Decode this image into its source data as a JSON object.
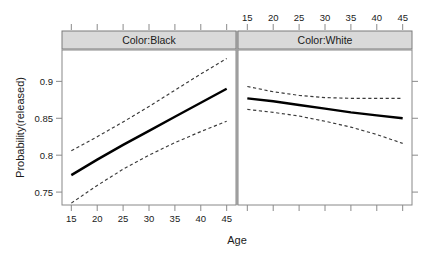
{
  "chart_data": {
    "type": "line",
    "title": "",
    "xlabel": "Age",
    "ylabel": "Probability(released)",
    "xlim": [
      13.2,
      46.8
    ],
    "ylim": [
      0.7325,
      0.9425
    ],
    "x_ticks": [
      15,
      20,
      25,
      30,
      35,
      40,
      45
    ],
    "x_tick_labels": [
      "15",
      "20",
      "25",
      "30",
      "35",
      "40",
      "45"
    ],
    "y_ticks": [
      0.75,
      0.8,
      0.85,
      0.9
    ],
    "y_tick_labels": [
      "0.75",
      "0.8",
      "0.85",
      "0.9"
    ],
    "grid": false,
    "legend": "none",
    "conditioning_variable": "Color",
    "panels": [
      {
        "strip_label": "Color:Black",
        "x_axis_position": "bottom",
        "x_axis_labelled": true,
        "series": [
          {
            "name": "fit",
            "style": "solid",
            "x": [
              15,
              20,
              25,
              30,
              35,
              40,
              45
            ],
            "y": [
              0.773,
              0.794,
              0.814,
              0.833,
              0.852,
              0.871,
              0.89
            ]
          },
          {
            "name": "upper 95% confidence limit",
            "style": "dashed",
            "x": [
              15,
              20,
              25,
              30,
              35,
              40,
              45
            ],
            "y": [
              0.806,
              0.825,
              0.845,
              0.866,
              0.888,
              0.91,
              0.931
            ]
          },
          {
            "name": "lower 95% confidence limit",
            "style": "dashed",
            "x": [
              15,
              20,
              25,
              30,
              35,
              40,
              45
            ],
            "y": [
              0.735,
              0.759,
              0.781,
              0.8,
              0.817,
              0.832,
              0.846
            ]
          }
        ]
      },
      {
        "strip_label": "Color:White",
        "x_axis_position": "top",
        "x_axis_labelled": true,
        "series": [
          {
            "name": "fit",
            "style": "solid",
            "x": [
              15,
              20,
              25,
              30,
              35,
              40,
              45
            ],
            "y": [
              0.877,
              0.873,
              0.868,
              0.863,
              0.858,
              0.854,
              0.85
            ]
          },
          {
            "name": "upper 95% confidence limit",
            "style": "dashed",
            "x": [
              15,
              20,
              25,
              30,
              35,
              40,
              45
            ],
            "y": [
              0.893,
              0.886,
              0.881,
              0.878,
              0.877,
              0.877,
              0.877
            ]
          },
          {
            "name": "lower 95% confidence limit",
            "style": "dashed",
            "x": [
              15,
              20,
              25,
              30,
              35,
              40,
              45
            ],
            "y": [
              0.862,
              0.858,
              0.853,
              0.846,
              0.838,
              0.828,
              0.816
            ]
          }
        ]
      }
    ]
  },
  "colors": {
    "strip_background": "#d9d9d9",
    "frame": "#888888",
    "fit_line": "#000000",
    "ci_line": "#3a3a3a",
    "text": "#1a1a1a",
    "page_background": "#ffffff"
  }
}
